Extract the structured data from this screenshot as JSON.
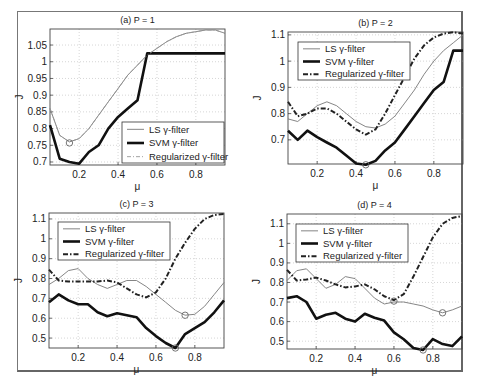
{
  "chart_data": [
    {
      "type": "line",
      "title": "(a) P = 1",
      "xlabel": "μ",
      "ylabel": "J",
      "xlim": [
        0.05,
        0.95
      ],
      "ylim": [
        0.691,
        1.098
      ],
      "xticks": [
        0.2,
        0.4,
        0.6,
        0.8
      ],
      "xtick_labels": [
        "0.2",
        "0.4",
        "0.6",
        "0.8"
      ],
      "yticks": [
        0.7,
        0.75,
        0.8,
        0.85,
        0.9,
        0.95,
        1.0,
        1.05
      ],
      "ytick_labels": [
        "0.7",
        "0.75",
        "0.8",
        "0.85",
        "0.9",
        "0.95",
        "1",
        "1.05"
      ],
      "grid": true,
      "legend": {
        "position": "lower right",
        "entries": [
          "LS γ-filter",
          "SVM γ-filter",
          "Regularized γ-filter"
        ]
      },
      "x": [
        0.05,
        0.1,
        0.15,
        0.2,
        0.25,
        0.3,
        0.35,
        0.4,
        0.45,
        0.5,
        0.55,
        0.6,
        0.65,
        0.7,
        0.75,
        0.8,
        0.85,
        0.9,
        0.95
      ],
      "series": [
        {
          "name": "LS γ-filter",
          "style": "thin",
          "values": [
            0.86,
            0.78,
            0.76,
            0.77,
            0.8,
            0.84,
            0.88,
            0.92,
            0.96,
            0.99,
            1.02,
            1.04,
            1.06,
            1.075,
            1.085,
            1.09,
            1.095,
            1.095,
            1.085
          ]
        },
        {
          "name": "SVM γ-filter",
          "style": "thick",
          "values": [
            0.81,
            0.71,
            0.7,
            0.695,
            0.73,
            0.75,
            0.8,
            0.835,
            0.86,
            0.885,
            1.025,
            1.025,
            1.025,
            1.025,
            1.025,
            1.025,
            1.025,
            1.025,
            1.025
          ]
        },
        {
          "name": "Regularized γ-filter",
          "style": "dashdot-thin",
          "values": [
            0.86,
            0.78,
            0.76,
            0.77,
            0.8,
            0.84,
            0.88,
            0.92,
            0.96,
            0.99,
            1.02,
            1.04,
            1.06,
            1.075,
            1.085,
            1.09,
            1.095,
            1.095,
            1.085
          ]
        }
      ],
      "markers": [
        {
          "x": 0.15,
          "y": 0.757
        }
      ]
    },
    {
      "type": "line",
      "title": "(b) P = 2",
      "xlabel": "μ",
      "ylabel": "J",
      "xlim": [
        0.05,
        0.95
      ],
      "ylim": [
        0.608,
        1.111
      ],
      "xticks": [
        0.2,
        0.4,
        0.6,
        0.8
      ],
      "xtick_labels": [
        "0.2",
        "0.4",
        "0.6",
        "0.8"
      ],
      "yticks": [
        0.7,
        0.8,
        0.9,
        1.0,
        1.1
      ],
      "ytick_labels": [
        "0.7",
        "0.8",
        "0.9",
        "1",
        "1.1"
      ],
      "grid": true,
      "legend": {
        "position": "upper left",
        "entries": [
          "LS γ-filter",
          "SVM γ-filter",
          "Regularized γ-filter"
        ]
      },
      "x": [
        0.05,
        0.1,
        0.15,
        0.2,
        0.25,
        0.3,
        0.35,
        0.4,
        0.45,
        0.5,
        0.55,
        0.6,
        0.65,
        0.7,
        0.75,
        0.8,
        0.85,
        0.9,
        0.95
      ],
      "series": [
        {
          "name": "LS γ-filter",
          "style": "thin",
          "values": [
            0.78,
            0.77,
            0.8,
            0.83,
            0.845,
            0.83,
            0.8,
            0.77,
            0.75,
            0.745,
            0.76,
            0.79,
            0.84,
            0.89,
            0.95,
            1.0,
            1.04,
            1.07,
            1.1
          ]
        },
        {
          "name": "SVM γ-filter",
          "style": "thick",
          "values": [
            0.735,
            0.7,
            0.735,
            0.71,
            0.69,
            0.67,
            0.64,
            0.61,
            0.605,
            0.62,
            0.66,
            0.69,
            0.74,
            0.79,
            0.84,
            0.89,
            0.92,
            1.04,
            1.04
          ]
        },
        {
          "name": "Regularized γ-filter",
          "style": "dashdot",
          "values": [
            0.845,
            0.79,
            0.8,
            0.82,
            0.82,
            0.8,
            0.77,
            0.74,
            0.72,
            0.74,
            0.8,
            0.87,
            0.94,
            1.01,
            1.06,
            1.09,
            1.105,
            1.11,
            1.105
          ]
        }
      ],
      "markers": [
        {
          "x": 0.45,
          "y": 0.605
        }
      ]
    },
    {
      "type": "line",
      "title": "(c) P = 3",
      "xlabel": "μ",
      "ylabel": "J",
      "xlim": [
        0.05,
        0.95
      ],
      "ylim": [
        0.45,
        1.13
      ],
      "xticks": [
        0.2,
        0.4,
        0.6,
        0.8
      ],
      "xtick_labels": [
        "0.2",
        "0.4",
        "0.6",
        "0.8"
      ],
      "yticks": [
        0.5,
        0.6,
        0.7,
        0.8,
        0.9,
        1.0,
        1.1
      ],
      "ytick_labels": [
        "0.5",
        "0.6",
        "0.7",
        "0.8",
        "0.9",
        "1",
        "1.1"
      ],
      "grid": true,
      "legend": {
        "position": "upper left",
        "entries": [
          "LS γ-filter",
          "SVM γ-filter",
          "Regularized γ-filter"
        ]
      },
      "x": [
        0.05,
        0.1,
        0.15,
        0.2,
        0.25,
        0.3,
        0.35,
        0.4,
        0.45,
        0.5,
        0.55,
        0.6,
        0.65,
        0.7,
        0.75,
        0.8,
        0.85,
        0.9,
        0.95
      ],
      "series": [
        {
          "name": "LS γ-filter",
          "style": "thin",
          "values": [
            0.77,
            0.8,
            0.84,
            0.85,
            0.8,
            0.77,
            0.75,
            0.77,
            0.79,
            0.79,
            0.76,
            0.72,
            0.68,
            0.64,
            0.615,
            0.62,
            0.66,
            0.72,
            0.78
          ]
        },
        {
          "name": "SVM γ-filter",
          "style": "thick",
          "values": [
            0.68,
            0.72,
            0.69,
            0.67,
            0.67,
            0.63,
            0.61,
            0.625,
            0.615,
            0.605,
            0.55,
            0.51,
            0.475,
            0.45,
            0.52,
            0.55,
            0.58,
            0.63,
            0.69
          ]
        },
        {
          "name": "Regularized γ-filter",
          "style": "dashdot",
          "values": [
            0.845,
            0.79,
            0.785,
            0.785,
            0.785,
            0.785,
            0.79,
            0.78,
            0.75,
            0.72,
            0.705,
            0.73,
            0.8,
            0.9,
            0.98,
            1.05,
            1.1,
            1.12,
            1.125
          ]
        }
      ],
      "markers": [
        {
          "x": 0.75,
          "y": 0.615
        },
        {
          "x": 0.7,
          "y": 0.45
        }
      ]
    },
    {
      "type": "line",
      "title": "(d) P = 4",
      "xlabel": "μ",
      "ylabel": "J",
      "xlim": [
        0.05,
        0.95
      ],
      "ylim": [
        0.46,
        1.15
      ],
      "xticks": [
        0.2,
        0.4,
        0.6,
        0.8
      ],
      "xtick_labels": [
        "0.2",
        "0.4",
        "0.6",
        "0.8"
      ],
      "yticks": [
        0.5,
        0.6,
        0.7,
        0.8,
        0.9,
        1.0,
        1.1
      ],
      "ytick_labels": [
        "0.5",
        "0.6",
        "0.7",
        "0.8",
        "0.9",
        "1",
        "1.1"
      ],
      "grid": true,
      "legend": {
        "position": "upper left",
        "entries": [
          "LS γ-filter",
          "SVM γ-filter",
          "Regularized γ-filter"
        ]
      },
      "x": [
        0.05,
        0.1,
        0.15,
        0.2,
        0.25,
        0.3,
        0.35,
        0.4,
        0.45,
        0.5,
        0.55,
        0.6,
        0.65,
        0.7,
        0.75,
        0.8,
        0.85,
        0.9,
        0.95
      ],
      "series": [
        {
          "name": "LS γ-filter",
          "style": "thin",
          "values": [
            0.81,
            0.86,
            0.87,
            0.82,
            0.77,
            0.79,
            0.83,
            0.82,
            0.77,
            0.72,
            0.69,
            0.7,
            0.7,
            0.69,
            0.68,
            0.66,
            0.645,
            0.66,
            0.68
          ]
        },
        {
          "name": "SVM γ-filter",
          "style": "thick",
          "values": [
            0.72,
            0.73,
            0.7,
            0.615,
            0.635,
            0.645,
            0.615,
            0.6,
            0.64,
            0.62,
            0.605,
            0.545,
            0.51,
            0.465,
            0.455,
            0.51,
            0.485,
            0.475,
            0.525
          ]
        },
        {
          "name": "Regularized γ-filter",
          "style": "dashdot",
          "values": [
            0.865,
            0.81,
            0.815,
            0.825,
            0.81,
            0.79,
            0.775,
            0.78,
            0.79,
            0.765,
            0.73,
            0.71,
            0.74,
            0.83,
            0.93,
            1.03,
            1.1,
            1.13,
            1.14
          ]
        }
      ],
      "markers": [
        {
          "x": 0.6,
          "y": 0.705
        },
        {
          "x": 0.85,
          "y": 0.645
        },
        {
          "x": 0.75,
          "y": 0.455
        }
      ]
    }
  ],
  "panels_layout": [
    {
      "left": 50,
      "top": 29,
      "right": 225,
      "bottom": 165
    },
    {
      "left": 288,
      "top": 32,
      "right": 463,
      "bottom": 164
    },
    {
      "left": 49,
      "top": 213,
      "right": 224,
      "bottom": 348
    },
    {
      "left": 287,
      "top": 214,
      "right": 462,
      "bottom": 349
    }
  ],
  "legend_boxes": [
    {
      "left": 122,
      "top": 122,
      "width": 102,
      "height": 41
    },
    {
      "left": 298,
      "top": 42,
      "width": 112,
      "height": 38
    },
    {
      "left": 58,
      "top": 222,
      "width": 112,
      "height": 38
    },
    {
      "left": 296,
      "top": 224,
      "width": 112,
      "height": 38
    }
  ]
}
